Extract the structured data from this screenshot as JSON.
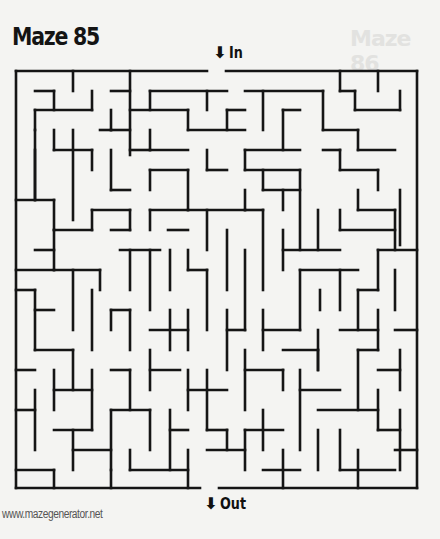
{
  "page": {
    "title": "Maze 85",
    "ghost_title": "Maze 86",
    "entrance_label": "In",
    "exit_label": "Out",
    "entrance_icon": "down-arrow-icon",
    "exit_icon": "down-arrow-icon",
    "arrow_glyph": "⬇",
    "footer": "www.mazegenerator.net"
  },
  "maze": {
    "stroke_color": "#151515",
    "stroke_width": 2.6,
    "grid": {
      "cols": 21,
      "rows": 22,
      "left": 16,
      "top": 71,
      "right": 417,
      "bottom": 488
    },
    "entrance_gap": [
      207,
      226
    ],
    "exit_gap": [
      200,
      219
    ],
    "segments": [
      [
        16,
        71,
        207,
        71
      ],
      [
        226,
        71,
        417,
        71
      ],
      [
        417,
        71,
        417,
        488
      ],
      [
        16,
        71,
        16,
        488
      ],
      [
        16,
        488,
        200,
        488
      ],
      [
        219,
        488,
        417,
        488
      ],
      [
        73,
        71,
        73,
        91
      ],
      [
        130,
        71,
        130,
        155
      ],
      [
        35,
        91,
        54,
        91
      ],
      [
        54,
        91,
        54,
        110
      ],
      [
        111,
        91,
        130,
        91
      ],
      [
        92,
        91,
        92,
        110
      ],
      [
        35,
        110,
        35,
        130
      ],
      [
        35,
        110,
        92,
        110
      ],
      [
        35,
        130,
        35,
        200
      ],
      [
        111,
        110,
        111,
        130
      ],
      [
        100,
        130,
        111,
        130
      ],
      [
        111,
        130,
        130,
        130
      ],
      [
        150,
        91,
        227,
        91
      ],
      [
        150,
        91,
        150,
        110
      ],
      [
        207,
        91,
        207,
        110
      ],
      [
        245,
        91,
        323,
        91
      ],
      [
        263,
        91,
        263,
        130
      ],
      [
        340,
        71,
        340,
        91
      ],
      [
        340,
        91,
        355,
        91
      ],
      [
        355,
        91,
        355,
        110
      ],
      [
        355,
        110,
        400,
        110
      ],
      [
        400,
        91,
        400,
        110
      ],
      [
        378,
        71,
        378,
        91
      ],
      [
        130,
        110,
        188,
        110
      ],
      [
        188,
        130,
        245,
        130
      ],
      [
        188,
        110,
        188,
        130
      ],
      [
        150,
        130,
        150,
        150
      ],
      [
        150,
        150,
        188,
        150
      ],
      [
        130,
        150,
        150,
        150
      ],
      [
        227,
        110,
        245,
        110
      ],
      [
        227,
        110,
        227,
        130
      ],
      [
        283,
        110,
        283,
        150
      ],
      [
        283,
        110,
        300,
        110
      ],
      [
        245,
        150,
        300,
        150
      ],
      [
        245,
        150,
        245,
        170
      ],
      [
        245,
        170,
        300,
        170
      ],
      [
        323,
        91,
        323,
        130
      ],
      [
        323,
        130,
        358,
        130
      ],
      [
        323,
        150,
        340,
        150
      ],
      [
        358,
        130,
        358,
        150
      ],
      [
        358,
        150,
        395,
        150
      ],
      [
        340,
        150,
        340,
        170
      ],
      [
        340,
        170,
        378,
        170
      ],
      [
        378,
        170,
        378,
        190
      ],
      [
        400,
        190,
        400,
        245
      ],
      [
        54,
        130,
        54,
        150
      ],
      [
        54,
        150,
        92,
        150
      ],
      [
        92,
        150,
        92,
        170
      ],
      [
        111,
        150,
        111,
        190
      ],
      [
        111,
        190,
        130,
        190
      ],
      [
        73,
        130,
        73,
        220
      ],
      [
        35,
        150,
        35,
        200
      ],
      [
        16,
        200,
        54,
        200
      ],
      [
        54,
        200,
        54,
        230
      ],
      [
        150,
        170,
        188,
        170
      ],
      [
        150,
        170,
        150,
        190
      ],
      [
        188,
        170,
        188,
        210
      ],
      [
        207,
        150,
        207,
        170
      ],
      [
        207,
        170,
        227,
        170
      ],
      [
        263,
        170,
        263,
        190
      ],
      [
        263,
        190,
        300,
        190
      ],
      [
        300,
        170,
        300,
        250
      ],
      [
        283,
        190,
        283,
        210
      ],
      [
        92,
        210,
        130,
        210
      ],
      [
        130,
        210,
        130,
        230
      ],
      [
        92,
        210,
        92,
        230
      ],
      [
        111,
        230,
        130,
        230
      ],
      [
        54,
        230,
        92,
        230
      ],
      [
        54,
        230,
        54,
        270
      ],
      [
        16,
        270,
        54,
        270
      ],
      [
        150,
        210,
        188,
        210
      ],
      [
        150,
        210,
        150,
        230
      ],
      [
        168,
        230,
        188,
        230
      ],
      [
        188,
        210,
        245,
        210
      ],
      [
        207,
        210,
        207,
        250
      ],
      [
        227,
        230,
        227,
        290
      ],
      [
        245,
        190,
        245,
        210
      ],
      [
        245,
        210,
        263,
        210
      ],
      [
        263,
        210,
        263,
        290
      ],
      [
        283,
        230,
        283,
        270
      ],
      [
        283,
        250,
        340,
        250
      ],
      [
        318,
        210,
        318,
        250
      ],
      [
        340,
        210,
        340,
        230
      ],
      [
        340,
        230,
        395,
        230
      ],
      [
        358,
        190,
        358,
        210
      ],
      [
        358,
        210,
        395,
        210
      ],
      [
        395,
        210,
        395,
        250
      ],
      [
        378,
        250,
        417,
        250
      ],
      [
        378,
        250,
        378,
        290
      ],
      [
        35,
        250,
        54,
        250
      ],
      [
        54,
        270,
        100,
        270
      ],
      [
        73,
        270,
        73,
        330
      ],
      [
        100,
        270,
        100,
        290
      ],
      [
        120,
        250,
        160,
        250
      ],
      [
        130,
        250,
        130,
        290
      ],
      [
        150,
        250,
        150,
        310
      ],
      [
        170,
        250,
        170,
        290
      ],
      [
        188,
        250,
        188,
        270
      ],
      [
        188,
        270,
        207,
        270
      ],
      [
        207,
        270,
        207,
        330
      ],
      [
        245,
        250,
        245,
        330
      ],
      [
        300,
        270,
        358,
        270
      ],
      [
        300,
        270,
        300,
        330
      ],
      [
        320,
        290,
        320,
        310
      ],
      [
        340,
        270,
        340,
        310
      ],
      [
        358,
        290,
        378,
        290
      ],
      [
        358,
        290,
        358,
        330
      ],
      [
        395,
        270,
        395,
        310
      ],
      [
        16,
        290,
        35,
        290
      ],
      [
        35,
        290,
        35,
        350
      ],
      [
        35,
        310,
        54,
        310
      ],
      [
        92,
        290,
        92,
        350
      ],
      [
        111,
        310,
        130,
        310
      ],
      [
        111,
        310,
        111,
        330
      ],
      [
        130,
        310,
        130,
        350
      ],
      [
        150,
        330,
        188,
        330
      ],
      [
        170,
        310,
        170,
        350
      ],
      [
        188,
        310,
        188,
        350
      ],
      [
        227,
        310,
        227,
        370
      ],
      [
        227,
        330,
        245,
        330
      ],
      [
        263,
        330,
        300,
        330
      ],
      [
        263,
        310,
        263,
        350
      ],
      [
        283,
        350,
        318,
        350
      ],
      [
        318,
        330,
        318,
        370
      ],
      [
        340,
        330,
        378,
        330
      ],
      [
        378,
        310,
        378,
        350
      ],
      [
        395,
        330,
        417,
        330
      ],
      [
        16,
        370,
        35,
        370
      ],
      [
        35,
        350,
        73,
        350
      ],
      [
        73,
        350,
        73,
        390
      ],
      [
        54,
        370,
        54,
        410
      ],
      [
        54,
        390,
        92,
        390
      ],
      [
        92,
        370,
        92,
        430
      ],
      [
        111,
        370,
        130,
        370
      ],
      [
        130,
        370,
        130,
        410
      ],
      [
        150,
        350,
        150,
        390
      ],
      [
        150,
        370,
        180,
        370
      ],
      [
        188,
        370,
        188,
        410
      ],
      [
        188,
        390,
        227,
        390
      ],
      [
        207,
        370,
        207,
        430
      ],
      [
        245,
        350,
        245,
        410
      ],
      [
        245,
        370,
        283,
        370
      ],
      [
        283,
        370,
        283,
        390
      ],
      [
        300,
        390,
        340,
        390
      ],
      [
        300,
        370,
        300,
        450
      ],
      [
        318,
        350,
        318,
        370
      ],
      [
        358,
        350,
        378,
        350
      ],
      [
        358,
        350,
        358,
        410
      ],
      [
        378,
        370,
        400,
        370
      ],
      [
        400,
        350,
        400,
        390
      ],
      [
        16,
        410,
        35,
        410
      ],
      [
        35,
        390,
        35,
        450
      ],
      [
        54,
        430,
        92,
        430
      ],
      [
        111,
        410,
        150,
        410
      ],
      [
        111,
        410,
        111,
        470
      ],
      [
        150,
        410,
        150,
        450
      ],
      [
        170,
        410,
        170,
        470
      ],
      [
        170,
        430,
        188,
        430
      ],
      [
        207,
        430,
        227,
        430
      ],
      [
        227,
        430,
        227,
        450
      ],
      [
        245,
        430,
        283,
        430
      ],
      [
        245,
        430,
        245,
        470
      ],
      [
        263,
        410,
        263,
        450
      ],
      [
        318,
        410,
        378,
        410
      ],
      [
        340,
        430,
        340,
        470
      ],
      [
        378,
        390,
        378,
        430
      ],
      [
        378,
        430,
        400,
        430
      ],
      [
        400,
        410,
        400,
        470
      ],
      [
        16,
        470,
        54,
        470
      ],
      [
        73,
        430,
        73,
        470
      ],
      [
        73,
        450,
        111,
        450
      ],
      [
        130,
        450,
        130,
        470
      ],
      [
        130,
        470,
        188,
        470
      ],
      [
        188,
        450,
        188,
        488
      ],
      [
        207,
        450,
        245,
        450
      ],
      [
        263,
        470,
        300,
        470
      ],
      [
        283,
        450,
        283,
        488
      ],
      [
        318,
        430,
        318,
        470
      ],
      [
        340,
        470,
        395,
        470
      ],
      [
        358,
        450,
        358,
        488
      ],
      [
        111,
        488,
        111,
        470
      ],
      [
        54,
        488,
        54,
        470
      ],
      [
        395,
        450,
        417,
        450
      ]
    ]
  }
}
